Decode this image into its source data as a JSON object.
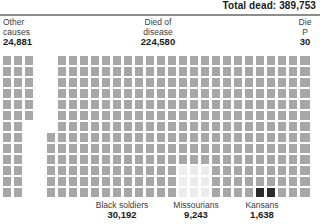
{
  "header": {
    "total_label": "Total dead: 389,753"
  },
  "columns": [
    {
      "id": "other-causes",
      "line1": "Other",
      "line2": "causes",
      "value": "24,881"
    },
    {
      "id": "died-of-disease",
      "line1": "Died of",
      "line2": "disease",
      "value": "224,580"
    },
    {
      "id": "died-as-prisoners",
      "line1": "Die",
      "line2": "P",
      "value": "30"
    }
  ],
  "subsets": [
    {
      "id": "black-soldiers",
      "label": "Black soldiers",
      "value": "30,192"
    },
    {
      "id": "missourians",
      "label": "Missourians",
      "value": "9,243"
    },
    {
      "id": "kansans",
      "label": "Kansans",
      "value": "1,638"
    }
  ],
  "colors": {
    "cell": "#a7a7a7",
    "cell_pale": "#ececec",
    "cell_dark": "#2b2b2b",
    "rule": "#8c8c8c",
    "text": "#3b3b3b",
    "background": "#ffffff"
  },
  "chart_data": {
    "type": "bar",
    "title": "Total dead: 389,753",
    "xlabel": "",
    "ylabel": "",
    "note": "Unit/isotype square chart: each square represents a unit of Civil War dead.",
    "categories": [
      "Other causes",
      "Died of disease",
      "Died as Prisoners"
    ],
    "values": [
      24881,
      224580,
      30000
    ],
    "highlight_categories": [
      "Black soldiers",
      "Missourians",
      "Kansans"
    ],
    "highlight_values": [
      30192,
      9243,
      1638
    ],
    "grid": false,
    "legend": "none"
  },
  "grid": {
    "cell_w": 8,
    "cell_h": 9,
    "pitch_x": 11,
    "pitch_y": 11,
    "left_block": {
      "origin_x": 3,
      "origin_y": 56,
      "rows": [
        3,
        3,
        3,
        3,
        3,
        3,
        2,
        2,
        2,
        2,
        2,
        2,
        2
      ]
    },
    "main_block": {
      "origin_x": 58,
      "origin_y": 56,
      "rows": [
        {
          "start": 0,
          "count": 23
        },
        {
          "start": 0,
          "count": 23
        },
        {
          "start": 0,
          "count": 23
        },
        {
          "start": 0,
          "count": 23
        },
        {
          "start": 0,
          "count": 23
        },
        {
          "start": 0,
          "count": 23
        },
        {
          "start": 0,
          "count": 23
        },
        {
          "start": -1,
          "count": 24
        },
        {
          "start": -1,
          "count": 24
        },
        {
          "start": -1,
          "count": 24
        },
        {
          "start": -1,
          "count": 24
        },
        {
          "start": -1,
          "count": 24
        },
        {
          "start": -1,
          "count": 24
        }
      ]
    },
    "right_block": {
      "origin_x": 302,
      "origin_y": 56,
      "rows": 13,
      "cols": 1
    },
    "pale_region": {
      "row_start": 10,
      "row_end": 12,
      "col_start": 11,
      "col_end": 13
    },
    "dark_cells": [
      {
        "row": 12,
        "col": 18
      },
      {
        "row": 12,
        "col": 19
      }
    ]
  }
}
